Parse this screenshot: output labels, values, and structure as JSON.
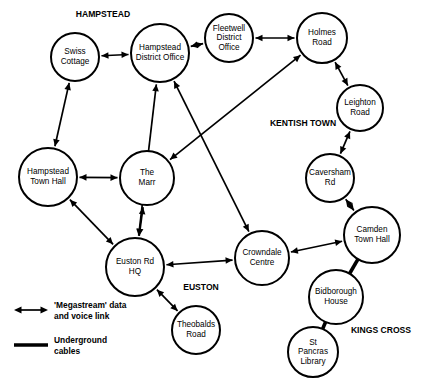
{
  "diagram": {
    "background_color": "#ffffff",
    "line_color": "#000000",
    "nodes": [
      {
        "id": "swiss_cottage",
        "label_lines": [
          "Swiss",
          "Cottage"
        ],
        "cx": 75,
        "cy": 57,
        "r": 24
      },
      {
        "id": "hampstead_district_office",
        "label_lines": [
          "Hampstead",
          "District Office"
        ],
        "cx": 160,
        "cy": 53,
        "r": 29
      },
      {
        "id": "fleetwell_district_office",
        "label_lines": [
          "Fleetwell",
          "District",
          "Office"
        ],
        "cx": 229,
        "cy": 38,
        "r": 24
      },
      {
        "id": "holmes_road",
        "label_lines": [
          "Holmes",
          "Road"
        ],
        "cx": 322,
        "cy": 38,
        "r": 25
      },
      {
        "id": "leighton_road",
        "label_lines": [
          "Leighton",
          "Road"
        ],
        "cx": 360,
        "cy": 108,
        "r": 23
      },
      {
        "id": "hampstead_town_hall",
        "label_lines": [
          "Hampstead",
          "Town Hall"
        ],
        "cx": 48,
        "cy": 177,
        "r": 29
      },
      {
        "id": "the_marr",
        "label_lines": [
          "The",
          "Marr"
        ],
        "cx": 147,
        "cy": 178,
        "r": 27
      },
      {
        "id": "caversham_rd",
        "label_lines": [
          "Caversham",
          "Rd"
        ],
        "cx": 330,
        "cy": 178,
        "r": 24
      },
      {
        "id": "camden_town_hall",
        "label_lines": [
          "Camden",
          "Town Hall"
        ],
        "cx": 372,
        "cy": 235,
        "r": 28
      },
      {
        "id": "crowndale_centre",
        "label_lines": [
          "Crowndale",
          "Centre"
        ],
        "cx": 262,
        "cy": 258,
        "r": 27
      },
      {
        "id": "euston_rd_hq",
        "label_lines": [
          "Euston Rd",
          "HQ"
        ],
        "cx": 135,
        "cy": 267,
        "r": 29
      },
      {
        "id": "bidborough_house",
        "label_lines": [
          "Bidborough",
          "House"
        ],
        "cx": 336,
        "cy": 297,
        "r": 27
      },
      {
        "id": "theobalds_road",
        "label_lines": [
          "Theobalds",
          "Road"
        ],
        "cx": 196,
        "cy": 330,
        "r": 24
      },
      {
        "id": "st_pancras_library",
        "label_lines": [
          "St",
          "Pancras",
          "Library"
        ],
        "cx": 313,
        "cy": 352,
        "r": 25
      }
    ],
    "area_labels": [
      {
        "id": "hampstead",
        "text": "HAMPSTEAD",
        "x": 103,
        "y": 15
      },
      {
        "id": "kentish_town",
        "text": "KENTISH TOWN",
        "x": 303,
        "y": 124
      },
      {
        "id": "euston",
        "text": "EUSTON",
        "x": 201,
        "y": 288
      },
      {
        "id": "kings_cross",
        "text": "KINGS CROSS",
        "x": 381,
        "y": 331
      }
    ],
    "links": [
      {
        "from": "swiss_cottage",
        "to": "hampstead_district_office",
        "type": "megastream"
      },
      {
        "from": "hampstead_district_office",
        "to": "fleetwell_district_office",
        "type": "megastream"
      },
      {
        "from": "fleetwell_district_office",
        "to": "holmes_road",
        "type": "megastream"
      },
      {
        "from": "holmes_road",
        "to": "leighton_road",
        "type": "megastream"
      },
      {
        "from": "leighton_road",
        "to": "caversham_rd",
        "type": "megastream"
      },
      {
        "from": "caversham_rd",
        "to": "camden_town_hall",
        "type": "megastream"
      },
      {
        "from": "camden_town_hall",
        "to": "crowndale_centre",
        "type": "megastream"
      },
      {
        "from": "swiss_cottage",
        "to": "hampstead_town_hall",
        "type": "megastream"
      },
      {
        "from": "hampstead_town_hall",
        "to": "the_marr",
        "type": "megastream"
      },
      {
        "from": "hampstead_town_hall",
        "to": "euston_rd_hq",
        "type": "megastream"
      },
      {
        "from": "the_marr",
        "to": "euston_rd_hq",
        "type": "megastream"
      },
      {
        "from": "the_marr",
        "to": "holmes_road",
        "type": "megastream"
      },
      {
        "from": "hampstead_district_office",
        "to": "crowndale_centre",
        "type": "megastream"
      },
      {
        "from": "euston_rd_hq",
        "to": "hampstead_district_office",
        "type": "megastream"
      },
      {
        "from": "euston_rd_hq",
        "to": "crowndale_centre",
        "type": "megastream"
      },
      {
        "from": "euston_rd_hq",
        "to": "theobalds_road",
        "type": "megastream"
      },
      {
        "from": "camden_town_hall",
        "to": "bidborough_house",
        "type": "cable"
      },
      {
        "from": "bidborough_house",
        "to": "st_pancras_library",
        "type": "cable"
      }
    ],
    "legend": {
      "items": [
        {
          "id": "megastream",
          "symbol": "double-arrow",
          "text_lines": [
            "'Megastream' data",
            "and voice link"
          ],
          "sym_x1": 14,
          "sym_x2": 48,
          "sym_y": 310,
          "text_x": 54,
          "text_y": 306
        },
        {
          "id": "underground",
          "symbol": "thick-line",
          "text_lines": [
            "Underground",
            "cables"
          ],
          "sym_x1": 14,
          "sym_x2": 48,
          "sym_y": 345,
          "text_x": 54,
          "text_y": 341
        }
      ]
    }
  }
}
